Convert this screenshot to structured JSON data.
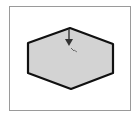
{
  "diagram": {
    "shape": "hexagon",
    "fill": "#d3d3d3",
    "stroke": "#111111",
    "frame_border": "#9a9a9a",
    "vertices": [
      [
        70,
        28
      ],
      [
        113,
        44
      ],
      [
        113,
        73
      ],
      [
        71,
        89
      ],
      [
        28,
        73
      ],
      [
        28,
        43
      ]
    ],
    "pointer": {
      "icon": "arrow-down-icon",
      "x": 69,
      "y1": 29,
      "y2": 46
    },
    "cursor_label": "✎"
  }
}
